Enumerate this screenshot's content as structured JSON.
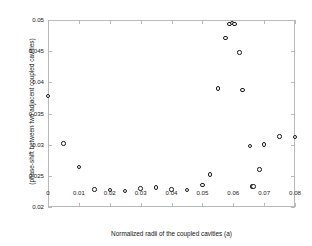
{
  "chart_data": {
    "type": "scatter",
    "title": "",
    "xlabel": "Normalized radii of the coupled cavities (a)",
    "ylabel": "(phase-shift between two adjacent coupled cavities)",
    "xlim": [
      0,
      0.08
    ],
    "ylim": [
      0.02,
      0.05
    ],
    "xticks": [
      0,
      0.01,
      0.02,
      0.03,
      0.04,
      0.05,
      0.06,
      0.07,
      0.08
    ],
    "xticklabels": [
      "0",
      "0.01",
      "0.02",
      "0.03",
      "0.04",
      "0.05",
      "0.06",
      "0.07",
      "0.08"
    ],
    "yticks": [
      0.02,
      0.025,
      0.03,
      0.035,
      0.04,
      0.045,
      0.05
    ],
    "yticklabels": [
      "0.02",
      "0.025",
      "0.03",
      "0.035",
      "0.04",
      "0.045",
      "0.05"
    ],
    "grid": false,
    "legend": false,
    "marker": "open-circle",
    "marker_color": "#1a1a1a",
    "series": [
      {
        "name": "phase-shift",
        "x": [
          0.0,
          0.005,
          0.01,
          0.015,
          0.02,
          0.025,
          0.03,
          0.035,
          0.04,
          0.045,
          0.05,
          0.0525,
          0.055,
          0.0575,
          0.0588,
          0.0596,
          0.0604,
          0.062,
          0.063,
          0.0655,
          0.066,
          0.0665,
          0.0685,
          0.07,
          0.075,
          0.08
        ],
        "y": [
          0.0378,
          0.0302,
          0.0264,
          0.0228,
          0.0227,
          0.0226,
          0.023,
          0.0231,
          0.0228,
          0.0227,
          0.0235,
          0.0252,
          0.039,
          0.0471,
          0.0494,
          0.0495,
          0.0494,
          0.0448,
          0.0388,
          0.0298,
          0.0233,
          0.0233,
          0.026,
          0.03,
          0.0313,
          0.0312
        ]
      }
    ]
  },
  "axes": {
    "x_title": "Normalized radii of the coupled cavities (a)",
    "y_title": "(phase-shift between two adjacent coupled cavities)"
  }
}
